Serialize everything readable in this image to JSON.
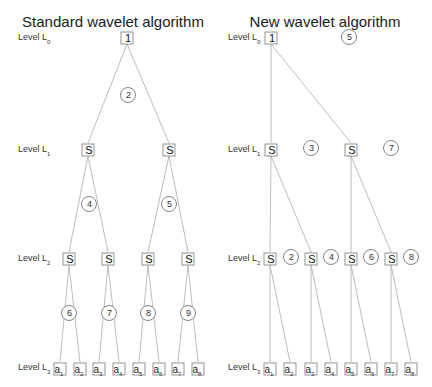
{
  "panels": [
    {
      "title": "Standard wavelet algorithm",
      "title_x": 113,
      "levels": [
        {
          "label": "Level L",
          "sub": "0",
          "x": 18,
          "y": 38
        },
        {
          "label": "Level L",
          "sub": "1",
          "x": 18,
          "y": 150
        },
        {
          "label": "Level L",
          "sub": "2",
          "x": 18,
          "y": 259
        },
        {
          "label": "Level L",
          "sub": "3",
          "x": 18,
          "y": 368
        }
      ],
      "nodes": [
        {
          "id": "L0",
          "text": "1",
          "x": 127,
          "y": 38,
          "kind": "root"
        },
        {
          "id": "L1a",
          "text": "S",
          "x": 88,
          "y": 150,
          "kind": "s"
        },
        {
          "id": "L1b",
          "text": "S",
          "x": 169,
          "y": 150,
          "kind": "s"
        },
        {
          "id": "L2a",
          "text": "S",
          "x": 69,
          "y": 259,
          "kind": "s"
        },
        {
          "id": "L2b",
          "text": "S",
          "x": 108,
          "y": 259,
          "kind": "s"
        },
        {
          "id": "L2c",
          "text": "S",
          "x": 148,
          "y": 259,
          "kind": "s"
        },
        {
          "id": "L2d",
          "text": "S",
          "x": 188,
          "y": 259,
          "kind": "s"
        },
        {
          "id": "a1",
          "text": "a",
          "sub": "1",
          "x": 60,
          "y": 369,
          "kind": "leaf"
        },
        {
          "id": "a2",
          "text": "a",
          "sub": "2",
          "x": 80,
          "y": 369,
          "kind": "leaf"
        },
        {
          "id": "a3",
          "text": "a",
          "sub": "3",
          "x": 99,
          "y": 369,
          "kind": "leaf"
        },
        {
          "id": "a4",
          "text": "a",
          "sub": "4",
          "x": 119,
          "y": 369,
          "kind": "leaf"
        },
        {
          "id": "a5",
          "text": "a",
          "sub": "5",
          "x": 139,
          "y": 369,
          "kind": "leaf"
        },
        {
          "id": "a6",
          "text": "a",
          "sub": "6",
          "x": 159,
          "y": 369,
          "kind": "leaf"
        },
        {
          "id": "a7",
          "text": "a",
          "sub": "7",
          "x": 178,
          "y": 369,
          "kind": "leaf"
        },
        {
          "id": "a8",
          "text": "a",
          "sub": "8",
          "x": 198,
          "y": 369,
          "kind": "leaf"
        }
      ],
      "edges": [
        [
          "L0",
          "L1a"
        ],
        [
          "L0",
          "L1b"
        ],
        [
          "L1a",
          "L2a"
        ],
        [
          "L1a",
          "L2b"
        ],
        [
          "L1b",
          "L2c"
        ],
        [
          "L1b",
          "L2d"
        ],
        [
          "L2a",
          "a1"
        ],
        [
          "L2a",
          "a2"
        ],
        [
          "L2b",
          "a3"
        ],
        [
          "L2b",
          "a4"
        ],
        [
          "L2c",
          "a5"
        ],
        [
          "L2c",
          "a6"
        ],
        [
          "L2d",
          "a7"
        ],
        [
          "L2d",
          "a8"
        ]
      ],
      "steps": [
        {
          "text": "2",
          "x": 128,
          "y": 95
        },
        {
          "text": "4",
          "x": 89,
          "y": 204
        },
        {
          "text": "5",
          "x": 169,
          "y": 204
        },
        {
          "text": "6",
          "x": 69,
          "y": 313
        },
        {
          "text": "7",
          "x": 109,
          "y": 313
        },
        {
          "text": "8",
          "x": 148,
          "y": 313
        },
        {
          "text": "9",
          "x": 188,
          "y": 313
        }
      ]
    },
    {
      "title": "New wavelet algorithm",
      "title_x": 325,
      "levels": [
        {
          "label": "Level L",
          "sub": "0",
          "x": 228,
          "y": 38
        },
        {
          "label": "Level L",
          "sub": "1",
          "x": 228,
          "y": 150
        },
        {
          "label": "Level L",
          "sub": "2",
          "x": 228,
          "y": 259
        },
        {
          "label": "Level L",
          "sub": "3",
          "x": 228,
          "y": 368
        }
      ],
      "nodes": [
        {
          "id": "L0",
          "text": "1",
          "x": 271,
          "y": 38,
          "kind": "root"
        },
        {
          "id": "L1a",
          "text": "S",
          "x": 271,
          "y": 150,
          "kind": "s"
        },
        {
          "id": "L1b",
          "text": "S",
          "x": 351,
          "y": 150,
          "kind": "s"
        },
        {
          "id": "L2a",
          "text": "S",
          "x": 270,
          "y": 259,
          "kind": "s"
        },
        {
          "id": "L2b",
          "text": "S",
          "x": 311,
          "y": 259,
          "kind": "s"
        },
        {
          "id": "L2c",
          "text": "S",
          "x": 351,
          "y": 259,
          "kind": "s"
        },
        {
          "id": "L2d",
          "text": "S",
          "x": 391,
          "y": 259,
          "kind": "s"
        },
        {
          "id": "a1",
          "text": "a",
          "sub": "1",
          "x": 270,
          "y": 369,
          "kind": "leaf"
        },
        {
          "id": "a2",
          "text": "a",
          "sub": "2",
          "x": 290,
          "y": 369,
          "kind": "leaf"
        },
        {
          "id": "a3",
          "text": "a",
          "sub": "3",
          "x": 311,
          "y": 369,
          "kind": "leaf"
        },
        {
          "id": "a4",
          "text": "a",
          "sub": "4",
          "x": 331,
          "y": 369,
          "kind": "leaf"
        },
        {
          "id": "a5",
          "text": "a",
          "sub": "5",
          "x": 351,
          "y": 369,
          "kind": "leaf"
        },
        {
          "id": "a6",
          "text": "a",
          "sub": "6",
          "x": 371,
          "y": 369,
          "kind": "leaf"
        },
        {
          "id": "a7",
          "text": "a",
          "sub": "7",
          "x": 391,
          "y": 369,
          "kind": "leaf"
        },
        {
          "id": "a8",
          "text": "a",
          "sub": "8",
          "x": 411,
          "y": 369,
          "kind": "leaf"
        }
      ],
      "edges": [
        [
          "L0",
          "L1a"
        ],
        [
          "L0",
          "L1b"
        ],
        [
          "L1a",
          "L2a"
        ],
        [
          "L1a",
          "L2b"
        ],
        [
          "L1b",
          "L2c"
        ],
        [
          "L1b",
          "L2d"
        ],
        [
          "L2a",
          "a1"
        ],
        [
          "L2a",
          "a2"
        ],
        [
          "L2b",
          "a3"
        ],
        [
          "L2b",
          "a4"
        ],
        [
          "L2c",
          "a5"
        ],
        [
          "L2c",
          "a6"
        ],
        [
          "L2d",
          "a7"
        ],
        [
          "L2d",
          "a8"
        ]
      ],
      "steps": [
        {
          "text": "5",
          "x": 349,
          "y": 37
        },
        {
          "text": "3",
          "x": 311,
          "y": 148
        },
        {
          "text": "7",
          "x": 391,
          "y": 148
        },
        {
          "text": "2",
          "x": 291,
          "y": 257
        },
        {
          "text": "4",
          "x": 331,
          "y": 257
        },
        {
          "text": "6",
          "x": 371,
          "y": 257
        },
        {
          "text": "8",
          "x": 411,
          "y": 257
        }
      ]
    }
  ]
}
